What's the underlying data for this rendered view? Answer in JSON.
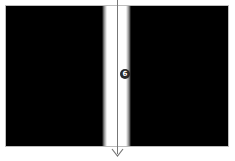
{
  "diagram": {
    "colors": {
      "panel": "#000000",
      "slit": "#ffffff",
      "frame_border": "#bdbdbd",
      "arrow": "#777777",
      "marker_fill": "#2a2a2a",
      "marker_text": "#ffffff"
    },
    "marker": {
      "label": "6"
    }
  }
}
